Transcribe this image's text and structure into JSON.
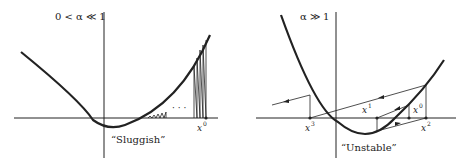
{
  "left_panel": {
    "title": "0 < α ≪ 1",
    "caption": "“Sluggish”",
    "x0_label": "x",
    "x0_sup": "0",
    "dots": "· · ·"
  },
  "right_panel": {
    "title": "α ≫ 1",
    "caption": "“Unstable”",
    "points": [
      {
        "base": "x",
        "sup": "0"
      },
      {
        "base": "x",
        "sup": "1"
      },
      {
        "base": "x",
        "sup": "2"
      },
      {
        "base": "x",
        "sup": "3"
      }
    ]
  },
  "colors": {
    "ink": "#222222",
    "background": "#ffffff"
  }
}
